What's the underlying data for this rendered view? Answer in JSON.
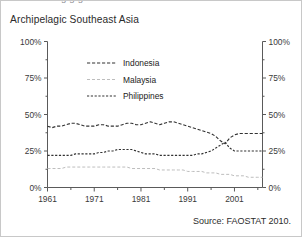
{
  "figure": {
    "title": "Archipelagic Southeast Asia",
    "clipped_top_text": "g  g  g",
    "source": "Source: FAOSTAT 2010."
  },
  "chart_data": {
    "type": "line",
    "title": "Archipelagic Southeast Asia",
    "xlabel": "",
    "ylabel": "",
    "xlim": [
      1961,
      2007
    ],
    "ylim": [
      0,
      100
    ],
    "grid": false,
    "legend_position": "upper-center",
    "y_tick_labels": [
      "0%",
      "25%",
      "50%",
      "75%",
      "100%"
    ],
    "y_ticks": [
      0,
      25,
      50,
      75,
      100
    ],
    "y_minor_ticks": [
      12.5,
      37.5,
      62.5,
      87.5
    ],
    "right_axis": true,
    "right_y_tick_labels": [
      "0%",
      "25%",
      "50%",
      "75%",
      "100%"
    ],
    "x_tick_labels": [
      "1961",
      "1971",
      "1981",
      "1991",
      "2001"
    ],
    "x_ticks": [
      1961,
      1971,
      1981,
      1991,
      2001
    ],
    "x_minor_ticks": [
      1966,
      1976,
      1986,
      1996,
      2006
    ],
    "x": [
      1961,
      1962,
      1963,
      1964,
      1965,
      1966,
      1967,
      1968,
      1969,
      1970,
      1971,
      1972,
      1973,
      1974,
      1975,
      1976,
      1977,
      1978,
      1979,
      1980,
      1981,
      1982,
      1983,
      1984,
      1985,
      1986,
      1987,
      1988,
      1989,
      1990,
      1991,
      1992,
      1993,
      1994,
      1995,
      1996,
      1997,
      1998,
      1999,
      2000,
      2001,
      2002,
      2003,
      2004,
      2005,
      2006,
      2007
    ],
    "series": [
      {
        "name": "Indonesia",
        "color": "#333333",
        "style": "dashed",
        "values": [
          42,
          41,
          42,
          42,
          43,
          44,
          44,
          43,
          42,
          42,
          42,
          43,
          43,
          42,
          42,
          42,
          43,
          44,
          44,
          43,
          43,
          44,
          45,
          44,
          43,
          44,
          45,
          45,
          44,
          43,
          42,
          41,
          40,
          39,
          38,
          37,
          35,
          32,
          30,
          34,
          36,
          37,
          37,
          37,
          37,
          37,
          37
        ]
      },
      {
        "name": "Malaysia",
        "color": "#bdbdbd",
        "style": "dashed",
        "values": [
          13,
          13,
          13,
          13,
          14,
          14,
          14,
          14,
          14,
          14,
          14,
          14,
          14,
          14,
          14,
          14,
          14,
          14,
          13,
          13,
          13,
          13,
          13,
          13,
          12,
          12,
          12,
          12,
          12,
          12,
          11,
          11,
          11,
          11,
          10,
          10,
          10,
          9,
          9,
          9,
          8,
          8,
          8,
          7,
          7,
          7,
          7
        ]
      },
      {
        "name": "Philippines",
        "color": "#333333",
        "style": "dashed",
        "values": [
          22,
          22,
          22,
          22,
          22,
          22,
          23,
          23,
          23,
          23,
          23,
          24,
          24,
          25,
          25,
          26,
          26,
          26,
          26,
          25,
          24,
          23,
          23,
          23,
          22,
          22,
          22,
          22,
          22,
          22,
          22,
          22,
          23,
          23,
          24,
          25,
          27,
          29,
          31,
          27,
          25,
          25,
          25,
          25,
          25,
          25,
          25
        ]
      }
    ]
  }
}
